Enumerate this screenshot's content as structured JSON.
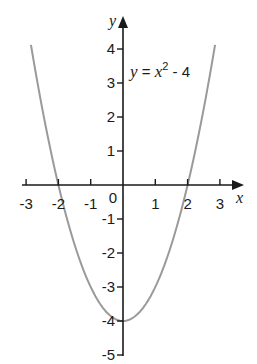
{
  "chart_data": {
    "type": "line",
    "title": "",
    "xlabel": "x",
    "ylabel": "y",
    "xlim": [
      -3,
      3
    ],
    "ylim": [
      -5,
      4
    ],
    "grid": false,
    "x_ticks": [
      -3,
      -2,
      -1,
      0,
      1,
      2,
      3
    ],
    "x_tick_labels": [
      "-3",
      "-2",
      "-1",
      "0",
      "1",
      "2",
      "3"
    ],
    "y_ticks": [
      4,
      3,
      2,
      1,
      -1,
      -2,
      -3,
      -4,
      -5
    ],
    "y_tick_labels": [
      "4",
      "3",
      "2",
      "1",
      "-1",
      "-2",
      "-3",
      "-4",
      "-5"
    ],
    "series": [
      {
        "name": "y = x² - 4",
        "function": "x^2 - 4",
        "color": "#9a9a9a",
        "x": [
          -2.85,
          -2.5,
          -2,
          -1.5,
          -1,
          -0.5,
          0,
          0.5,
          1,
          1.5,
          2,
          2.5,
          2.85
        ],
        "y": [
          4.12,
          2.25,
          0,
          -1.75,
          -3,
          -3.75,
          -4,
          -3.75,
          -3,
          -1.75,
          0,
          2.25,
          4.12
        ]
      }
    ],
    "annotations": [
      {
        "text": "y = x² - 4",
        "x": 0.2,
        "y": 3.3
      }
    ],
    "roots": [
      -2,
      2
    ],
    "vertex": [
      0,
      -4
    ],
    "colors": {
      "axis": "#1a1a1a",
      "curve": "#9a9a9a",
      "background": "#ffffff"
    }
  },
  "labels": {
    "x_axis": "x",
    "y_axis": "y",
    "equation_y": "y",
    "equation_eq": " = ",
    "equation_x": "x",
    "equation_exp": "2",
    "equation_rest": " - 4",
    "origin": "0"
  }
}
